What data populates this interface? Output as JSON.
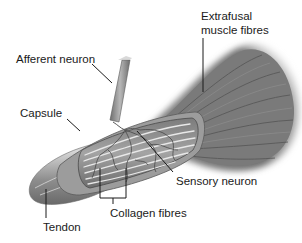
{
  "diagram": {
    "labels": {
      "extrafusal_line1": "Extrafusal",
      "extrafusal_line2": "muscle fibres",
      "afferent": "Afferent neuron",
      "capsule": "Capsule",
      "sensory": "Sensory neuron",
      "collagen": "Collagen fibres",
      "tendon": "Tendon"
    },
    "colors": {
      "background": "#ffffff",
      "muscle": "#7a7a7a",
      "muscle_dark": "#555555",
      "tendon": "#9a9a9a",
      "tendon_light": "#c8c8c8",
      "capsule_inner": "#8c8c8c",
      "fibre_light": "#e6e6e6",
      "neuron": "#8a8a8a",
      "text": "#1a1a1a"
    }
  }
}
